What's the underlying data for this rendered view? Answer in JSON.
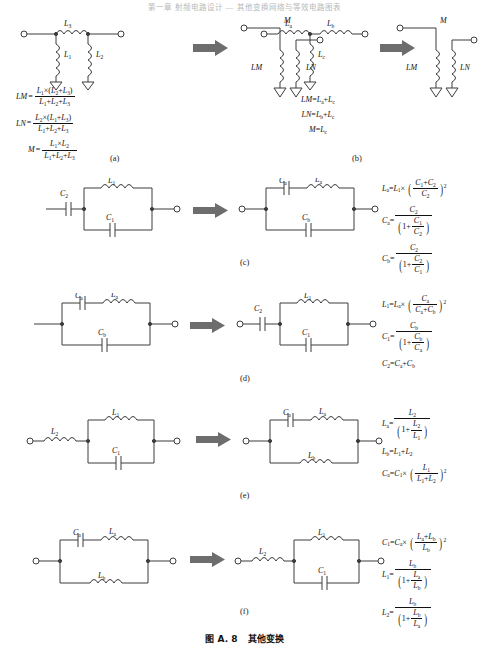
{
  "header": {
    "running_text": "第一章 射频电路设计 — 其他变换网络与等效电路图表"
  },
  "figure": {
    "caption_number": "图 A. 8",
    "caption_title": "其他变换"
  },
  "subfigure_labels": {
    "a": "(a)",
    "b": "(b)",
    "c": "(c)",
    "d": "(d)",
    "e": "(e)",
    "f": "(f)"
  },
  "rows": [
    {
      "id": "a",
      "left_circuit": {
        "name": "tee-inductor-network",
        "components": [
          "L3",
          "L1",
          "L2"
        ],
        "labels": [
          {
            "base": "L",
            "sub": "3"
          },
          {
            "base": "L",
            "sub": "1"
          },
          {
            "base": "L",
            "sub": "2"
          }
        ]
      },
      "right_circuit": {
        "name": "coupled-transformer",
        "labels": [
          {
            "base": "M",
            "sub": ""
          },
          {
            "base": "LM",
            "sub": ""
          },
          {
            "base": "LN",
            "sub": ""
          }
        ]
      },
      "formulas": [
        {
          "lhs": "LM",
          "num": "L1 × (L2 + L3)",
          "den": "L1 + L2 + L3"
        },
        {
          "lhs": "LN",
          "num": "L2 × (L1 + L3)",
          "den": "L1 + L2 + L3"
        },
        {
          "lhs": "M",
          "num": "L1 × L2",
          "den": "L1 + L2 + L3"
        }
      ]
    },
    {
      "id": "b",
      "left_circuit": {
        "name": "tee-inductor-network",
        "labels": [
          {
            "base": "L",
            "sub": "a"
          },
          {
            "base": "L",
            "sub": "b"
          },
          {
            "base": "L",
            "sub": "c"
          }
        ]
      },
      "right_circuit": {
        "name": "coupled-transformer",
        "labels": [
          {
            "base": "M",
            "sub": ""
          },
          {
            "base": "LM",
            "sub": ""
          },
          {
            "base": "LN",
            "sub": ""
          }
        ]
      },
      "formulas": [
        {
          "text": "LM = La + Lc"
        },
        {
          "text": "LN = Lb + Lc"
        },
        {
          "text": "M = Lc"
        }
      ]
    },
    {
      "id": "c",
      "left_circuit": {
        "name": "series-cap-parallel-lc",
        "labels": [
          {
            "base": "C",
            "sub": "2"
          },
          {
            "base": "L",
            "sub": "1"
          },
          {
            "base": "C",
            "sub": "1"
          }
        ]
      },
      "right_circuit": {
        "name": "cap-ind-series-over-cap",
        "labels": [
          {
            "base": "C",
            "sub": "a"
          },
          {
            "base": "L",
            "sub": "a"
          },
          {
            "base": "C",
            "sub": "b"
          }
        ]
      },
      "formulas": [
        {
          "kind": "prod_sq",
          "lhs": "La",
          "factor": "L1",
          "num": "C1 + C2",
          "den": "C2",
          "power": "2"
        },
        {
          "kind": "frac_nested",
          "lhs": "Ca",
          "num": "C2",
          "den_one": "1 +",
          "den_num": "C1",
          "den_den": "C2"
        },
        {
          "kind": "frac_nested",
          "lhs": "Cb",
          "num": "C2",
          "den_one": "1 +",
          "den_num": "C2",
          "den_den": "C1"
        }
      ]
    },
    {
      "id": "d",
      "left_circuit": {
        "name": "cap-ind-series-over-cap",
        "labels": [
          {
            "base": "C",
            "sub": "a"
          },
          {
            "base": "L",
            "sub": "a"
          },
          {
            "base": "C",
            "sub": "b"
          }
        ]
      },
      "right_circuit": {
        "name": "series-cap-parallel-lc",
        "labels": [
          {
            "base": "C",
            "sub": "2"
          },
          {
            "base": "L",
            "sub": "1"
          },
          {
            "base": "C",
            "sub": "1"
          }
        ]
      },
      "formulas": [
        {
          "kind": "prod_sq",
          "lhs": "L1",
          "factor": "La",
          "num": "Ca",
          "den": "Ca + Cb",
          "power": "2"
        },
        {
          "kind": "frac_nested",
          "lhs": "C1",
          "num": "Cb",
          "den_one": "1 +",
          "den_num": "Cb",
          "den_den": "Ca"
        },
        {
          "kind": "plain",
          "text": "C2 = Ca + Cb"
        }
      ]
    },
    {
      "id": "e",
      "left_circuit": {
        "name": "series-ind-parallel-lc",
        "labels": [
          {
            "base": "L",
            "sub": "2"
          },
          {
            "base": "L",
            "sub": "1"
          },
          {
            "base": "C",
            "sub": "1"
          }
        ]
      },
      "right_circuit": {
        "name": "cap-ind-series-over-ind",
        "labels": [
          {
            "base": "C",
            "sub": "a"
          },
          {
            "base": "L",
            "sub": "a"
          },
          {
            "base": "L",
            "sub": "b"
          }
        ]
      },
      "formulas": [
        {
          "kind": "frac_nested",
          "lhs": "La",
          "num": "L2",
          "den_one": "1 +",
          "den_num": "L2",
          "den_den": "L1"
        },
        {
          "kind": "plain",
          "text": "Lb = L1 + L2"
        },
        {
          "kind": "prod_sq",
          "lhs": "Ca",
          "factor": "C1",
          "num": "L1",
          "den": "L1 + L2",
          "power": "2"
        }
      ]
    },
    {
      "id": "f",
      "left_circuit": {
        "name": "cap-ind-series-over-ind",
        "labels": [
          {
            "base": "C",
            "sub": "a"
          },
          {
            "base": "L",
            "sub": "a"
          },
          {
            "base": "L",
            "sub": "b"
          }
        ]
      },
      "right_circuit": {
        "name": "series-ind-parallel-lc",
        "labels": [
          {
            "base": "L",
            "sub": "2"
          },
          {
            "base": "L",
            "sub": "1"
          },
          {
            "base": "C",
            "sub": "1"
          }
        ]
      },
      "formulas": [
        {
          "kind": "prod_sq",
          "lhs": "C1",
          "factor": "Ca",
          "num": "La + Lb",
          "den": "Lb",
          "power": "2"
        },
        {
          "kind": "frac_nested",
          "lhs": "L1",
          "num": "Lb",
          "den_one": "1 +",
          "den_num": "La",
          "den_den": "Lb"
        },
        {
          "kind": "frac_nested",
          "lhs": "L2",
          "num": "Lb",
          "den_one": "1 +",
          "den_num": "Lb",
          "den_den": "La"
        }
      ]
    }
  ],
  "colors": {
    "arrow": "#6d6d6d",
    "wire": "#3c3c3c",
    "text": "#111111",
    "page_bg": "#ffffff"
  },
  "arrow_glyph": "transform-arrow-right"
}
